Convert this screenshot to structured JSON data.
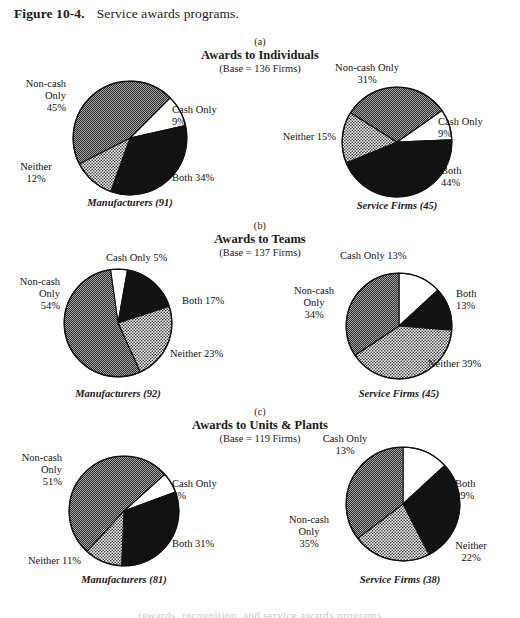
{
  "figure": {
    "label": "Figure 10-4.",
    "title": "Service awards programs."
  },
  "legend_keys": {
    "cash_only": "Cash Only",
    "both": "Both",
    "neither": "Neither",
    "non_cash_only": "Non-cash Only"
  },
  "colors": {
    "cash_only": "#ffffff",
    "both": "#111111",
    "neither": "#bdbdbd",
    "non_cash_only": "#6e6e6e",
    "outline": "#111111",
    "text": "#111111",
    "page_background": "#ffffff"
  },
  "sections": [
    {
      "letter": "(a)",
      "title": "Awards to Individuals",
      "base": "(Base = 136 Firms)"
    },
    {
      "letter": "(b)",
      "title": "Awards to Teams",
      "base": "(Base = 137 Firms)"
    },
    {
      "letter": "(c)",
      "title": "Awards to Units & Plants",
      "base": "(Base = 119 Firms)"
    }
  ],
  "bottom_bleed_text": "rewards, recognition, and service awards programs",
  "chart_data": [
    {
      "type": "pie",
      "id": "a-manufacturers",
      "title": "Awards to Individuals",
      "subtitle": "(Base = 136 Firms)",
      "panel": "(a)",
      "caption": "Manufacturers (91)",
      "group": "Manufacturers",
      "n": 91,
      "start_angle": 45,
      "labels": [
        "Cash Only",
        "Both",
        "Neither",
        "Non-cash Only"
      ],
      "values": [
        9,
        34,
        12,
        45
      ],
      "label_texts": [
        "Cash Only\n9%",
        "Both 34%",
        "Neither\n12%",
        "Non-cash\nOnly\n45%"
      ],
      "fills": [
        "white",
        "black",
        "light-gray",
        "dark-gray"
      ]
    },
    {
      "type": "pie",
      "id": "a-service",
      "title": "Awards to Individuals",
      "subtitle": "(Base = 136 Firms)",
      "panel": "(a)",
      "caption": "Service Firms (45)",
      "group": "Service Firms",
      "n": 45,
      "start_angle": 55,
      "labels": [
        "Cash Only",
        "Both",
        "Neither",
        "Non-cash Only"
      ],
      "values": [
        9,
        44,
        15,
        31
      ],
      "label_texts": [
        "Cash Only\n9%",
        "Both\n44%",
        "Neither 15%",
        "Non-cash Only\n31%"
      ],
      "fills": [
        "white",
        "black",
        "light-gray",
        "dark-gray"
      ]
    },
    {
      "type": "pie",
      "id": "b-manufacturers",
      "title": "Awards to Teams",
      "subtitle": "(Base = 137 Firms)",
      "panel": "(b)",
      "caption": "Manufacturers (92)",
      "group": "Manufacturers",
      "n": 92,
      "start_angle": 352,
      "labels": [
        "Cash Only",
        "Both",
        "Neither",
        "Non-cash Only"
      ],
      "values": [
        5,
        17,
        23,
        54
      ],
      "label_texts": [
        "Cash Only 5%",
        "Both 17%",
        "Neither 23%",
        "Non-cash\nOnly\n54%"
      ],
      "fills": [
        "white",
        "black",
        "light-gray",
        "dark-gray"
      ]
    },
    {
      "type": "pie",
      "id": "b-service",
      "title": "Awards to Teams",
      "subtitle": "(Base = 137 Firms)",
      "panel": "(b)",
      "caption": "Service Firms (45)",
      "group": "Service Firms",
      "n": 45,
      "start_angle": 0,
      "labels": [
        "Cash Only",
        "Both",
        "Neither",
        "Non-cash Only"
      ],
      "values": [
        13,
        13,
        39,
        34
      ],
      "label_texts": [
        "Cash Only 13%",
        "Both\n13%",
        "Neither 39%",
        "Non-cash\nOnly\n34%"
      ],
      "fills": [
        "white",
        "black",
        "light-gray",
        "dark-gray"
      ]
    },
    {
      "type": "pie",
      "id": "c-manufacturers",
      "title": "Awards to Units & Plants",
      "subtitle": "(Base = 119 Firms)",
      "panel": "(c)",
      "caption": "Manufacturers (81)",
      "group": "Manufacturers",
      "n": 81,
      "start_angle": 48,
      "labels": [
        "Cash Only",
        "Both",
        "Neither",
        "Non-cash Only"
      ],
      "values": [
        6,
        31,
        11,
        51
      ],
      "label_texts": [
        "Cash Only\n6%",
        "Both 31%",
        "Neither 11%",
        "Non-cash\nOnly\n51%"
      ],
      "fills": [
        "white",
        "black",
        "light-gray",
        "dark-gray"
      ]
    },
    {
      "type": "pie",
      "id": "c-service",
      "title": "Awards to Units & Plants",
      "subtitle": "(Base = 119 Firms)",
      "panel": "(c)",
      "caption": "Service Firms (38)",
      "group": "Service Firms",
      "n": 38,
      "start_angle": 0,
      "labels": [
        "Cash Only",
        "Both",
        "Neither",
        "Non-cash Only"
      ],
      "values": [
        13,
        29,
        22,
        35
      ],
      "label_texts": [
        "Cash Only\n13%",
        "Both\n29%",
        "Neither\n22%",
        "Non-cash\nOnly\n35%"
      ],
      "fills": [
        "white",
        "black",
        "light-gray",
        "dark-gray"
      ]
    }
  ],
  "pie_labels": {
    "a_man": {
      "cash": "Cash Only\n9%",
      "both": "Both 34%",
      "neither": "Neither\n12%",
      "noncash": "Non-cash\nOnly\n45%",
      "caption": "Manufacturers (91)"
    },
    "a_svc": {
      "cash": "Cash Only\n9%",
      "both": "Both\n44%",
      "neither": "Neither 15%",
      "noncash": "Non-cash Only\n31%",
      "caption": "Service Firms (45)"
    },
    "b_man": {
      "cash": "Cash Only 5%",
      "both": "Both 17%",
      "neither": "Neither 23%",
      "noncash": "Non-cash\nOnly\n54%",
      "caption": "Manufacturers (92)"
    },
    "b_svc": {
      "cash": "Cash Only 13%",
      "both": "Both\n13%",
      "neither": "Neither 39%",
      "noncash": "Non-cash\nOnly\n34%",
      "caption": "Service Firms (45)"
    },
    "c_man": {
      "cash": "Cash Only\n6%",
      "both": "Both 31%",
      "neither": "Neither 11%",
      "noncash": "Non-cash\nOnly\n51%",
      "caption": "Manufacturers (81)"
    },
    "c_svc": {
      "cash": "Cash Only\n13%",
      "both": "Both\n29%",
      "neither": "Neither\n22%",
      "noncash": "Non-cash\nOnly\n35%",
      "caption": "Service Firms (38)"
    }
  }
}
